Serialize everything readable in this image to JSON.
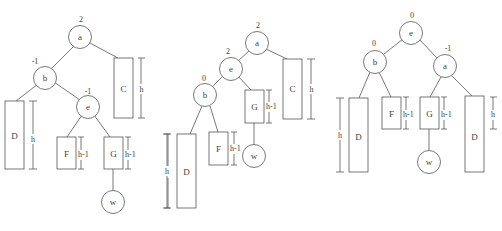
{
  "figure": {
    "panels": [
      {
        "id": "before",
        "nodes": [
          {
            "name": "a",
            "balance": "2"
          },
          {
            "name": "b",
            "balance": "-1"
          },
          {
            "name": "e",
            "balance": "-1"
          },
          {
            "name": "w",
            "balance": ""
          }
        ],
        "subtrees": [
          {
            "name": "C",
            "height": "h"
          },
          {
            "name": "D",
            "height": "h"
          },
          {
            "name": "F",
            "height": "h-1"
          },
          {
            "name": "G",
            "height": "h-1"
          }
        ],
        "extra_height_label": "h"
      },
      {
        "id": "after-first-rotation",
        "nodes": [
          {
            "name": "a",
            "balance": "2"
          },
          {
            "name": "e",
            "balance": "2"
          },
          {
            "name": "b",
            "balance": "0"
          },
          {
            "name": "w",
            "balance": ""
          }
        ],
        "subtrees": [
          {
            "name": "C",
            "height": "h"
          },
          {
            "name": "G",
            "height": "h-1"
          },
          {
            "name": "F",
            "height": "h-1"
          },
          {
            "name": "D",
            "height": "h"
          }
        ]
      },
      {
        "id": "after-second-rotation",
        "nodes": [
          {
            "name": "e",
            "balance": "0"
          },
          {
            "name": "b",
            "balance": "0"
          },
          {
            "name": "a",
            "balance": "-1"
          },
          {
            "name": "w",
            "balance": ""
          }
        ],
        "subtrees": [
          {
            "name": "D",
            "height": "h"
          },
          {
            "name": "F",
            "height": "h-1"
          },
          {
            "name": "G",
            "height": "h-1"
          },
          {
            "name": "D",
            "height": "h"
          }
        ]
      }
    ]
  }
}
